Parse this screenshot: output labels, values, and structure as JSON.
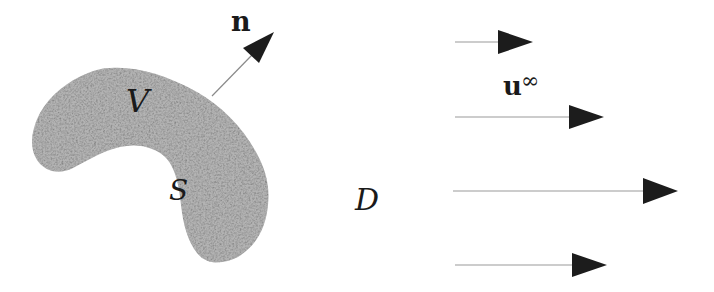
{
  "figure": {
    "background_color": "#ffffff",
    "body_region": {
      "fill_color": "#b3b3b3",
      "volume_label": "V",
      "surface_label": "S"
    },
    "normal_arrow": {
      "label": "n"
    },
    "domain": {
      "label": "D"
    },
    "freestream": {
      "label_base": "u",
      "label_superscript": "∞"
    },
    "colors": {
      "arrowhead": "#1c1c1c",
      "shaft": "#999999",
      "normal_shaft": "#8a8a8a",
      "grain": "#848484"
    }
  }
}
